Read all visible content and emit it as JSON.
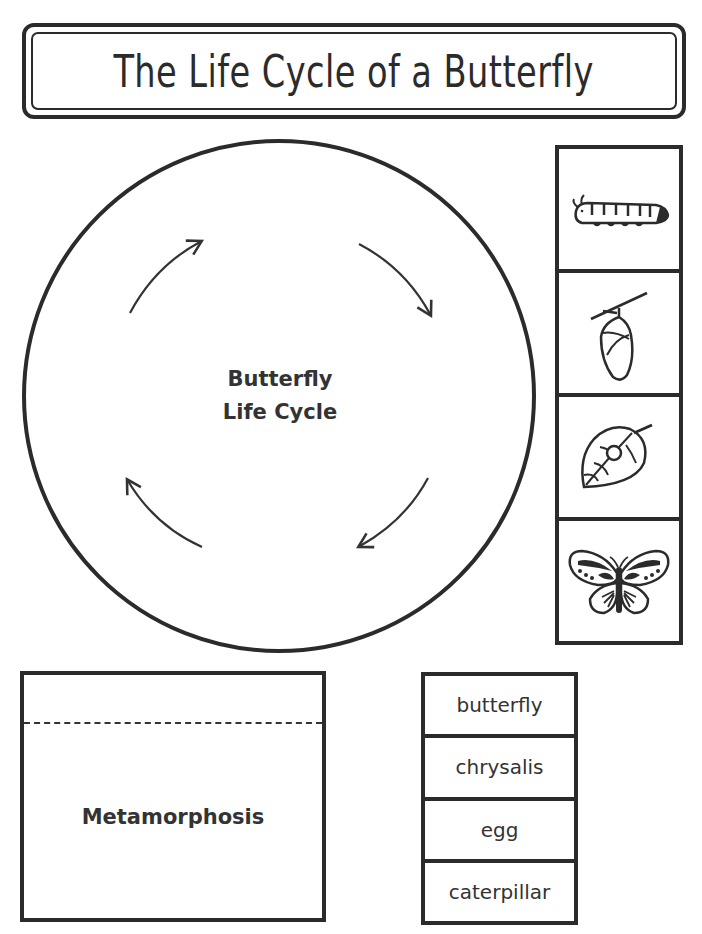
{
  "title": "The Life Cycle of a Butterfly",
  "cycle_wheel": {
    "center_label_line1": "Butterfly",
    "center_label_line2": "Life Cycle",
    "arrows": [
      "arrow-top-left",
      "arrow-top-right",
      "arrow-bottom-right",
      "arrow-bottom-left"
    ]
  },
  "picture_cards": [
    {
      "icon": "caterpillar-icon"
    },
    {
      "icon": "chrysalis-icon"
    },
    {
      "icon": "egg-on-leaf-icon"
    },
    {
      "icon": "butterfly-icon"
    }
  ],
  "metamorphosis_box": {
    "label": "Metamorphosis"
  },
  "word_cards": [
    {
      "label": "butterfly"
    },
    {
      "label": "chrysalis"
    },
    {
      "label": "egg"
    },
    {
      "label": "caterpillar"
    }
  ],
  "colors": {
    "ink": "#2b2b2b",
    "paper": "#ffffff"
  }
}
